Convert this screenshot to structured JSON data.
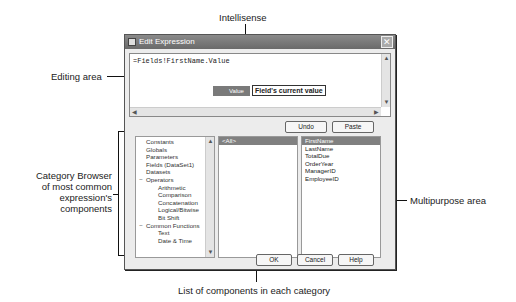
{
  "callouts": {
    "intellisense": "Intellisense",
    "editing_area": "Editing area",
    "category_browser": [
      "Category Browser",
      "of most common",
      "expression's",
      "components"
    ],
    "multipurpose_area": "Multipurpose area",
    "components_list": "List of components in each category"
  },
  "dialog": {
    "title": "Edit Expression",
    "close_icon": "close-icon",
    "editor": {
      "value": "=Fields!FirstName.Value",
      "intellisense_item": "Value",
      "intellisense_tooltip": "Field's current value"
    },
    "buttons": {
      "undo": "Undo",
      "paste": "Paste",
      "ok": "OK",
      "cancel": "Cancel",
      "help": "Help"
    },
    "categories": [
      {
        "label": "Constants",
        "level": 0
      },
      {
        "label": "Globals",
        "level": 0
      },
      {
        "label": "Parameters",
        "level": 0
      },
      {
        "label": "Fields (DataSet1)",
        "level": 0
      },
      {
        "label": "Datasets",
        "level": 0
      },
      {
        "label": "Operators",
        "level": 0,
        "expander": "−"
      },
      {
        "label": "Arithmetic",
        "level": 1
      },
      {
        "label": "Comparison",
        "level": 1
      },
      {
        "label": "Concatenation",
        "level": 1
      },
      {
        "label": "Logical/Bitwise",
        "level": 1
      },
      {
        "label": "Bit Shift",
        "level": 1
      },
      {
        "label": "Common Functions",
        "level": 0,
        "expander": "−"
      },
      {
        "label": "Text",
        "level": 1
      },
      {
        "label": "Date & Time",
        "level": 1
      }
    ],
    "components": [
      "<All>"
    ],
    "components_selected": 0,
    "multipurpose": [
      "FirstName",
      "LastName",
      "TotalDue",
      "OrderYear",
      "ManagerID",
      "EmployeeID"
    ],
    "multipurpose_selected": 0
  }
}
